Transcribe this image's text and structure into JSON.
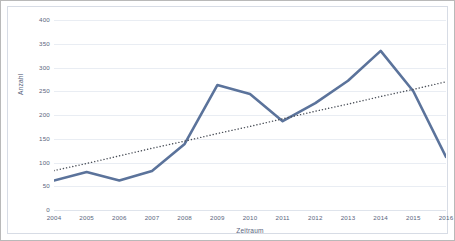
{
  "chart_data": {
    "type": "line",
    "title": "",
    "xlabel": "Zeitraum",
    "ylabel": "Anzahl",
    "categories": [
      "2004",
      "2005",
      "2006",
      "2007",
      "2008",
      "2009",
      "2010",
      "2011",
      "2012",
      "2013",
      "2014",
      "2015",
      "2016"
    ],
    "ylim": [
      0,
      400
    ],
    "ytick_labels": [
      "400",
      "350",
      "300",
      "250",
      "200",
      "150",
      "100",
      "50",
      "0"
    ],
    "ytick_values": [
      400,
      350,
      300,
      250,
      200,
      150,
      100,
      50,
      0
    ],
    "grid": true,
    "legend": "none",
    "series": [
      {
        "name": "Anzahl",
        "style": "solid",
        "color": "#5b739b",
        "width": 2.6,
        "values": [
          62,
          80,
          62,
          82,
          139,
          263,
          244,
          187,
          225,
          272,
          335,
          250,
          112
        ]
      },
      {
        "name": "Trendlinie",
        "style": "dotted",
        "color": "#4a4f58",
        "width": 1.4,
        "values": [
          83,
          98,
          114,
          130,
          145,
          161,
          176,
          192,
          208,
          223,
          239,
          254,
          270
        ]
      }
    ]
  },
  "colors": {
    "series_line": "#5b739b",
    "trendline": "#4a4f58",
    "gridline": "#e9edf3",
    "tick_text": "#59657d",
    "outer_border": "#b9b9b9",
    "plot_border": "#d7dce5",
    "background": "#ffffff"
  }
}
